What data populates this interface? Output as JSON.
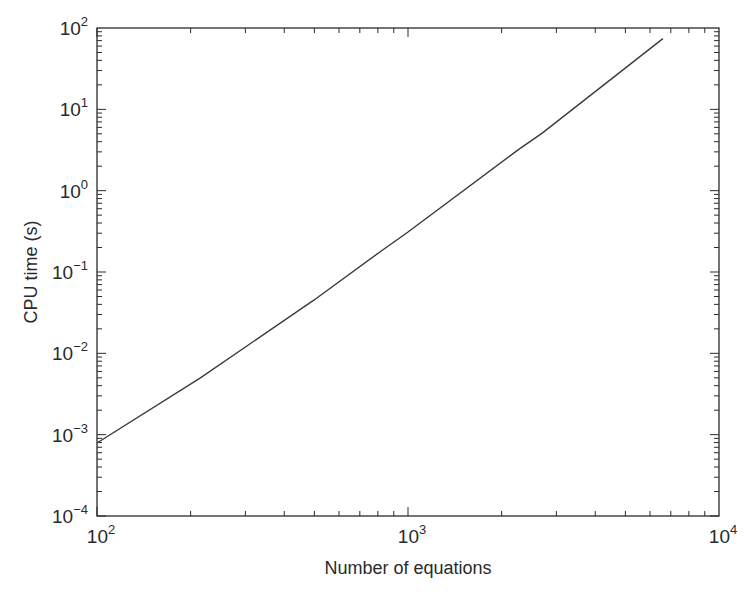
{
  "chart_data": {
    "type": "line",
    "title": "",
    "xlabel": "Number of equations",
    "ylabel": "CPU time (s)",
    "xscale": "log",
    "yscale": "log",
    "xlim": [
      100,
      10000
    ],
    "ylim": [
      0.0001,
      100
    ],
    "grid": false,
    "legend": null,
    "x_ticks": [
      {
        "base": "10",
        "exp": "2",
        "value": 100
      },
      {
        "base": "10",
        "exp": "3",
        "value": 1000
      },
      {
        "base": "10",
        "exp": "4",
        "value": 10000
      }
    ],
    "y_ticks": [
      {
        "base": "10",
        "exp": "−4",
        "value": 0.0001
      },
      {
        "base": "10",
        "exp": "−3",
        "value": 0.001
      },
      {
        "base": "10",
        "exp": "−2",
        "value": 0.01
      },
      {
        "base": "10",
        "exp": "−1",
        "value": 0.1
      },
      {
        "base": "10",
        "exp": "0",
        "value": 1
      },
      {
        "base": "10",
        "exp": "1",
        "value": 10
      },
      {
        "base": "10",
        "exp": "2",
        "value": 100
      }
    ],
    "series": [
      {
        "name": "CPU time",
        "color": "#3a3a3a",
        "x": [
          100,
          215,
          498,
          818,
          1000,
          2265,
          2700,
          6600
        ],
        "y": [
          0.00079,
          0.005,
          0.045,
          0.18,
          0.31,
          3.2,
          5.1,
          74
        ]
      }
    ]
  },
  "colors": {
    "axis": "#2a2a2a",
    "line": "#3a3a3a",
    "background": "#ffffff"
  }
}
